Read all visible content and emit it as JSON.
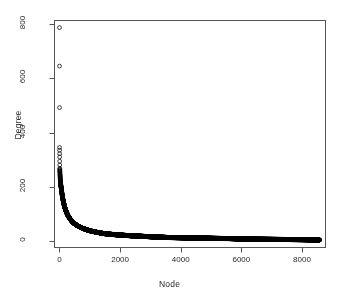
{
  "chart_data": {
    "type": "scatter",
    "title": "",
    "xlabel": "Node",
    "ylabel": "Degree",
    "xlim": [
      -180,
      8760
    ],
    "ylim": [
      -22,
      815
    ],
    "xticks": [
      0,
      2000,
      4000,
      6000,
      8000
    ],
    "yticks": [
      0,
      200,
      400,
      600,
      800
    ],
    "xticklabels": [
      "0",
      "2000",
      "4000",
      "6000",
      "8000"
    ],
    "yticklabels": [
      "0",
      "200",
      "400",
      "600",
      "800"
    ],
    "grid": false,
    "legend": null,
    "marker": "open-circle",
    "marker_size": 2.6,
    "marker_color": "#000000",
    "box": true,
    "n_points": 8580,
    "notable_points": [
      {
        "x": 1,
        "y": 787
      },
      {
        "x": 2,
        "y": 645
      },
      {
        "x": 3,
        "y": 492
      },
      {
        "x": 4,
        "y": 345
      },
      {
        "x": 5,
        "y": 335
      },
      {
        "x": 6,
        "y": 322
      },
      {
        "x": 7,
        "y": 310
      },
      {
        "x": 10,
        "y": 268
      },
      {
        "x": 15,
        "y": 255
      },
      {
        "x": 25,
        "y": 232
      },
      {
        "x": 40,
        "y": 210
      },
      {
        "x": 60,
        "y": 195
      },
      {
        "x": 90,
        "y": 170
      },
      {
        "x": 140,
        "y": 140
      },
      {
        "x": 200,
        "y": 115
      },
      {
        "x": 300,
        "y": 90
      },
      {
        "x": 450,
        "y": 68
      },
      {
        "x": 700,
        "y": 50
      },
      {
        "x": 1000,
        "y": 38
      },
      {
        "x": 1500,
        "y": 27
      },
      {
        "x": 2000,
        "y": 22
      },
      {
        "x": 2800,
        "y": 17
      },
      {
        "x": 3600,
        "y": 13
      },
      {
        "x": 4600,
        "y": 11
      },
      {
        "x": 5600,
        "y": 9
      },
      {
        "x": 6300,
        "y": 7
      },
      {
        "x": 7200,
        "y": 6
      },
      {
        "x": 8000,
        "y": 5
      },
      {
        "x": 8580,
        "y": 4
      }
    ]
  },
  "axes": {
    "x_label_text": "Node",
    "y_label_text": "Degree"
  }
}
